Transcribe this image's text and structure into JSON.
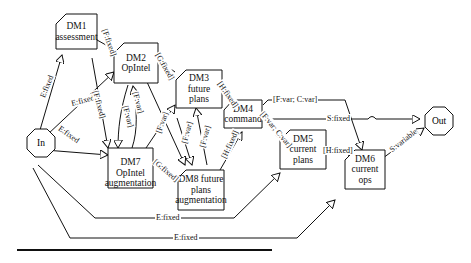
{
  "diagram": {
    "type": "decision-module-flow",
    "terminals": {
      "input": "In",
      "output": "Out"
    },
    "nodes": [
      {
        "id": "DM1",
        "line1": "DM1",
        "line2": "assessment",
        "line3": ""
      },
      {
        "id": "DM2",
        "line1": "DM2",
        "line2": "OpIntel",
        "line3": ""
      },
      {
        "id": "DM3",
        "line1": "DM3",
        "line2": "future",
        "line3": "plans"
      },
      {
        "id": "DM4",
        "line1": "DM4",
        "line2": "command",
        "line3": ""
      },
      {
        "id": "DM5",
        "line1": "DM5",
        "line2": "current",
        "line3": "plans"
      },
      {
        "id": "DM6",
        "line1": "DM6",
        "line2": "current",
        "line3": "ops"
      },
      {
        "id": "DM7",
        "line1": "DM7 OpIntel",
        "line2": "augmentation",
        "line3": ""
      },
      {
        "id": "DM8",
        "line1": "DM8 future",
        "line2": "plans",
        "line3": "augmentation"
      }
    ],
    "edge_labels": {
      "in_dm1": "E:fixed",
      "in_dm2": "E:fixed",
      "in_dm7": "E:fixed",
      "in_dm5": "E:fixed",
      "in_dm6": "E:fixed",
      "dm1_dm2": "[F:fixed]",
      "dm1_dm7": "[F:fixed]",
      "dm2_dm7_a": "[F:var]",
      "dm7_dm2_b": "[F:var]",
      "dm2_dm3": "[G:fixed]",
      "dm2_dm8": "[F:var]",
      "dm7_dm3": "[F:var]",
      "dm7_dm8": "[G:fixed]",
      "dm8_dm3_a": "[F:var]",
      "dm3_dm8_b": "[F:var]",
      "dm3_dm4": "[H:fixed]",
      "dm8_dm4": "[H:fixed]",
      "dm4_dm6": "[F:var; C:var]",
      "dm4_dm5": "[F:var; C:var]",
      "dm4_out": "S:fixed",
      "dm5_dm6": "[H:fixed]",
      "dm6_out": "S:variable"
    }
  }
}
